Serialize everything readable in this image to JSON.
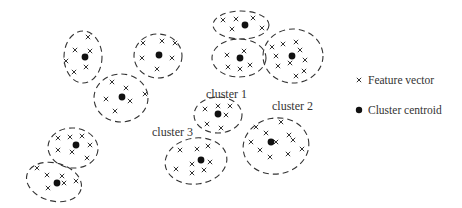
{
  "diagram": {
    "width": 462,
    "height": 208,
    "colors": {
      "stroke": "#333333",
      "centroid": "#111111",
      "text": "#333333",
      "background": "#ffffff"
    },
    "legend": {
      "items": [
        {
          "symbol": "x-mark",
          "label": "Feature vector",
          "x": 356,
          "y": 84
        },
        {
          "symbol": "dot",
          "label": "Cluster centroid",
          "x": 356,
          "y": 114
        }
      ]
    },
    "labels": [
      {
        "text": "cluster 1",
        "x": 206,
        "y": 98
      },
      {
        "text": "cluster 2",
        "x": 272,
        "y": 110
      },
      {
        "text": "cluster 3",
        "x": 152,
        "y": 136
      }
    ],
    "clusters": [
      {
        "id": "c-a",
        "cx": 83,
        "cy": 57,
        "rx": 19,
        "ry": 26,
        "rot": 0,
        "centroid": [
          85,
          57
        ],
        "points": [
          [
            88,
            37
          ],
          [
            75,
            50
          ],
          [
            90,
            51
          ],
          [
            66,
            61
          ],
          [
            86,
            67
          ],
          [
            74,
            72
          ]
        ]
      },
      {
        "id": "c-b",
        "cx": 121,
        "cy": 98,
        "rx": 27,
        "ry": 24,
        "rot": 0,
        "centroid": [
          122,
          97
        ],
        "points": [
          [
            112,
            82
          ],
          [
            126,
            88
          ],
          [
            106,
            99
          ],
          [
            130,
            101
          ],
          [
            145,
            94
          ],
          [
            115,
            111
          ]
        ]
      },
      {
        "id": "c-c",
        "cx": 158,
        "cy": 56,
        "rx": 24,
        "ry": 22,
        "rot": 0,
        "centroid": [
          159,
          55
        ],
        "points": [
          [
            143,
            43
          ],
          [
            162,
            41
          ],
          [
            175,
            43
          ],
          [
            142,
            58
          ],
          [
            172,
            58
          ],
          [
            157,
            69
          ]
        ]
      },
      {
        "id": "c-d",
        "cx": 241,
        "cy": 25,
        "rx": 28,
        "ry": 14,
        "rot": 0,
        "centroid": [
          245,
          25
        ],
        "points": [
          [
            223,
            20
          ],
          [
            236,
            19
          ],
          [
            253,
            18
          ],
          [
            232,
            29
          ],
          [
            262,
            28
          ]
        ]
      },
      {
        "id": "c-e",
        "cx": 239,
        "cy": 58,
        "rx": 27,
        "ry": 19,
        "rot": 0,
        "centroid": [
          240,
          58
        ],
        "points": [
          [
            227,
            55
          ],
          [
            244,
            51
          ],
          [
            228,
            67
          ],
          [
            240,
            69
          ],
          [
            250,
            65
          ]
        ]
      },
      {
        "id": "c-f",
        "cx": 293,
        "cy": 56,
        "rx": 30,
        "ry": 27,
        "rot": 0,
        "centroid": [
          292,
          56
        ],
        "points": [
          [
            272,
            47
          ],
          [
            283,
            44
          ],
          [
            296,
            42
          ],
          [
            276,
            56
          ],
          [
            300,
            50
          ],
          [
            305,
            60
          ],
          [
            278,
            66
          ],
          [
            290,
            63
          ],
          [
            304,
            71
          ],
          [
            296,
            76
          ]
        ]
      },
      {
        "id": "c-1",
        "cx": 218,
        "cy": 115,
        "rx": 24,
        "ry": 18,
        "rot": 0,
        "centroid": [
          218,
          114
        ],
        "points": [
          [
            205,
            109
          ],
          [
            218,
            106
          ],
          [
            230,
            106
          ],
          [
            226,
            115
          ],
          [
            207,
            124
          ],
          [
            221,
            128
          ]
        ]
      },
      {
        "id": "c-2",
        "cx": 276,
        "cy": 146,
        "rx": 33,
        "ry": 28,
        "rot": -10,
        "centroid": [
          271,
          142
        ],
        "points": [
          [
            281,
            122
          ],
          [
            256,
            127
          ],
          [
            266,
            133
          ],
          [
            289,
            135
          ],
          [
            293,
            140
          ],
          [
            251,
            142
          ],
          [
            260,
            150
          ],
          [
            288,
            154
          ],
          [
            302,
            149
          ],
          [
            270,
            157
          ],
          [
            276,
            142
          ]
        ]
      },
      {
        "id": "c-3",
        "cx": 196,
        "cy": 161,
        "rx": 31,
        "ry": 23,
        "rot": -8,
        "centroid": [
          201,
          160
        ],
        "points": [
          [
            180,
            150
          ],
          [
            197,
            149
          ],
          [
            208,
            146
          ],
          [
            192,
            164
          ],
          [
            210,
            162
          ],
          [
            176,
            169
          ],
          [
            192,
            173
          ],
          [
            204,
            170
          ]
        ]
      },
      {
        "id": "c-g",
        "cx": 73,
        "cy": 148,
        "rx": 25,
        "ry": 20,
        "rot": 5,
        "centroid": [
          76,
          145
        ],
        "points": [
          [
            58,
            138
          ],
          [
            70,
            137
          ],
          [
            82,
            136
          ],
          [
            58,
            150
          ],
          [
            72,
            152
          ],
          [
            90,
            145
          ],
          [
            87,
            158
          ]
        ]
      },
      {
        "id": "c-h",
        "cx": 54,
        "cy": 182,
        "rx": 28,
        "ry": 19,
        "rot": 15,
        "centroid": [
          57,
          183
        ],
        "points": [
          [
            37,
            168
          ],
          [
            47,
            175
          ],
          [
            62,
            176
          ],
          [
            48,
            188
          ],
          [
            64,
            183
          ],
          [
            76,
            181
          ]
        ]
      }
    ]
  }
}
